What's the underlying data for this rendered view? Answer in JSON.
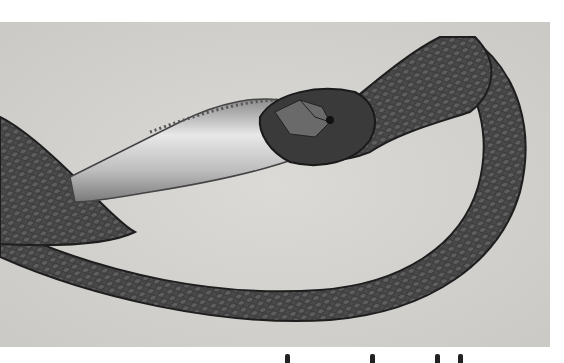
{
  "photo": {
    "subject": "snake swallowing a fish",
    "style": "black-and-white photograph",
    "colors": {
      "background": "#d6d4d1",
      "snake_dark": "#2e2e2e",
      "snake_mid": "#555555",
      "fish_light": "#c9c9c9",
      "fish_highlight": "#f2f2f2"
    }
  },
  "caption": {
    "visible": false,
    "note": "caption text cut off at bottom edge; only glyph tops visible, not legible"
  }
}
